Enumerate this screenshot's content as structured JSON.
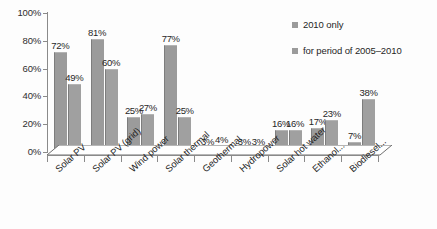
{
  "chart_data": {
    "type": "bar",
    "title": "",
    "xlabel": "",
    "ylabel": "",
    "ylim": [
      0,
      100
    ],
    "yticks": [
      "0%",
      "20%",
      "40%",
      "60%",
      "80%",
      "100%"
    ],
    "grid": false,
    "legend_position": "top-right",
    "categories": [
      "Solar PV",
      "Solar PV (grid)",
      "Wind power",
      "Solar thermal",
      "Geothermal",
      "Hydropower",
      "Solar hot water",
      "Ethanol...",
      "Biodiesel..."
    ],
    "series": [
      {
        "name": "2010 only",
        "values": [
          72,
          81,
          25,
          77,
          3,
          3,
          16,
          17,
          7
        ],
        "labels": [
          "72%",
          "81%",
          "25%",
          "77%",
          "3%",
          "3%",
          "16%",
          "17%",
          "7%"
        ]
      },
      {
        "name": "for period of 2005–2010",
        "values": [
          49,
          60,
          27,
          25,
          4,
          3,
          16,
          23,
          38
        ],
        "labels": [
          "49%",
          "60%",
          "27%",
          "25%",
          "4%",
          "3%",
          "16%",
          "23%",
          "38%"
        ]
      }
    ],
    "colors": {
      "series_1": "#9b9b9b",
      "series_2": "#a0a0a0",
      "axis": "#8a8a8a",
      "text": "#1f1f1f",
      "background": "#fdfdfd"
    }
  },
  "legend": {
    "items": [
      {
        "label": "2010 only"
      },
      {
        "label": "for period of 2005–2010"
      }
    ]
  }
}
